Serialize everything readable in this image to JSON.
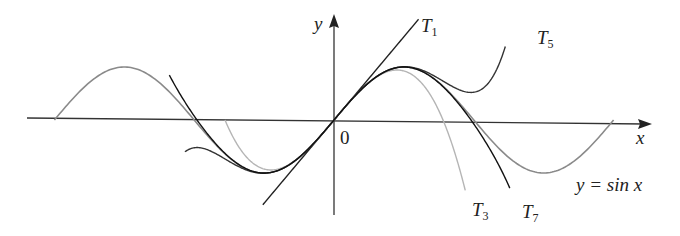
{
  "chart_data": {
    "type": "line",
    "title": "",
    "xlabel": "x",
    "ylabel": "y",
    "origin_label": "0",
    "xlim": [
      -6.6,
      6.9
    ],
    "ylim": [
      -1.8,
      1.95
    ],
    "grid": false,
    "series": [
      {
        "name": "y = sin x",
        "label_main": "y = sin x",
        "function": "sin",
        "x_range": [
          -6.283,
          6.283
        ],
        "color": "#8a8a8a"
      },
      {
        "name": "T1",
        "label_main": "T",
        "label_sub": "1",
        "function": "x",
        "x_range": [
          -1.6,
          1.9
        ],
        "color": "#222222"
      },
      {
        "name": "T3",
        "label_main": "T",
        "label_sub": "3",
        "function": "x - x^3/6",
        "x_range": [
          -2.45,
          2.95
        ],
        "color": "#b5b5b5"
      },
      {
        "name": "T5",
        "label_main": "T",
        "label_sub": "5",
        "function": "x - x^3/6 + x^5/120",
        "x_range": [
          -3.35,
          3.85
        ],
        "color": "#333333"
      },
      {
        "name": "T7",
        "label_main": "T",
        "label_sub": "7",
        "function": "x - x^3/6 + x^5/120 - x^7/5040",
        "x_range": [
          -3.7,
          3.95
        ],
        "color": "#111111"
      }
    ]
  },
  "labels": {
    "x_axis": "x",
    "y_axis": "y",
    "origin": "0",
    "sin_label": "y = sin x",
    "t1_main": "T",
    "t1_sub": "1",
    "t3_main": "T",
    "t3_sub": "3",
    "t5_main": "T",
    "t5_sub": "5",
    "t7_main": "T",
    "t7_sub": "7"
  }
}
